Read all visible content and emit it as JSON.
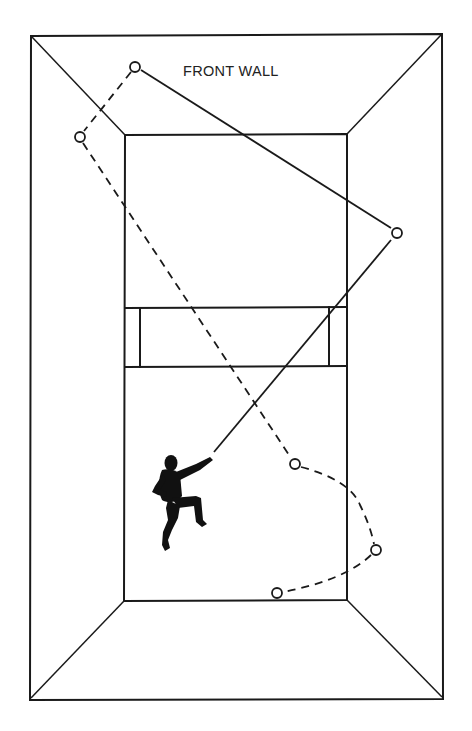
{
  "diagram": {
    "label": "FRONT WALL",
    "colors": {
      "ink": "#1a1a1a",
      "background": "#ffffff"
    },
    "court": {
      "outer_rect": {
        "x1": 31,
        "y1": 35,
        "x2": 443,
        "y2": 699
      },
      "inner_rect": {
        "x1": 125,
        "y1": 134,
        "x2": 347,
        "y2": 601
      },
      "service_zone": {
        "top_y": 307,
        "bottom_y": 367,
        "left_box_x": 140,
        "right_box_x": 329
      }
    },
    "bounce_points": [
      {
        "id": 1,
        "x": 135,
        "y": 67
      },
      {
        "id": 2,
        "x": 80,
        "y": 137
      },
      {
        "id": 3,
        "x": 397,
        "y": 233
      },
      {
        "id": 4,
        "x": 295,
        "y": 464
      },
      {
        "id": 5,
        "x": 376,
        "y": 550
      },
      {
        "id": 6,
        "x": 277,
        "y": 593
      }
    ],
    "shot_paths": [
      {
        "name": "racket-to-side-wall",
        "style": "solid",
        "from": "player",
        "to": 3
      },
      {
        "name": "side-wall-to-front-wall",
        "style": "solid",
        "from": 3,
        "to": 1
      },
      {
        "name": "front-wall-to-side-wall",
        "style": "dashed",
        "from": 1,
        "to": 2
      },
      {
        "name": "side-wall-to-floor",
        "style": "dashed",
        "from": 2,
        "to": 4
      },
      {
        "name": "floor-to-side-wall",
        "style": "dashed",
        "from": 4,
        "to": 5
      },
      {
        "name": "side-wall-to-back",
        "style": "dashed",
        "from": 5,
        "to": 6
      }
    ],
    "player": {
      "x": 150,
      "y": 452,
      "width": 62,
      "height": 100,
      "pose": "overhead-swing"
    }
  }
}
